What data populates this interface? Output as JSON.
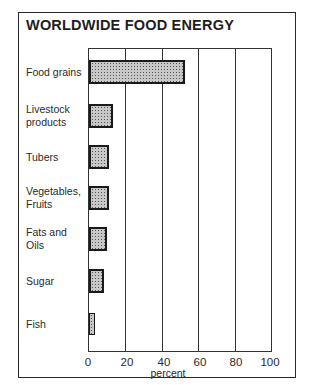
{
  "chart_data": {
    "type": "bar",
    "orientation": "horizontal",
    "title": "WORLDWIDE FOOD ENERGY",
    "xlabel": "percent",
    "ylabel": "",
    "categories": [
      "Food grains",
      "Livestock products",
      "Tubers",
      "Vegetables, Fruits",
      "Fats and Oils",
      "Sugar",
      "Fish"
    ],
    "category_lines": [
      [
        "Food grains"
      ],
      [
        "Livestock",
        "products"
      ],
      [
        "Tubers"
      ],
      [
        "Vegetables,",
        "Fruits"
      ],
      [
        "Fats and",
        "Oils"
      ],
      [
        "Sugar"
      ],
      [
        "Fish"
      ]
    ],
    "values": [
      52,
      13,
      11,
      11,
      10,
      8,
      3
    ],
    "xlim": [
      0,
      100
    ],
    "xticks": [
      "0",
      "20",
      "40",
      "60",
      "80",
      "100"
    ],
    "grid": true,
    "legend": null
  }
}
